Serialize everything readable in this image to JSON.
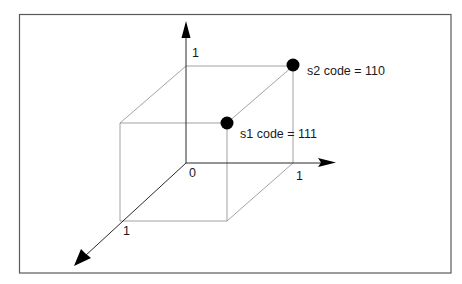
{
  "diagram": {
    "title": "",
    "type": "3D unit cube with binary state codes",
    "colors": {
      "frame": "#5a5a5a",
      "cube_edges": "#8c8c8c",
      "axes": "#2a2a2a",
      "points": "#000000",
      "text": "#1a1a1a"
    },
    "axes": {
      "vertical": {
        "tick_label": "1"
      },
      "horizontal": {
        "tick_label": "1"
      },
      "depth": {
        "tick_label": "1"
      },
      "origin_label": "0"
    },
    "points": [
      {
        "id": "s1",
        "label": "s1 code = 111"
      },
      {
        "id": "s2",
        "label": "s2 code = 110"
      }
    ]
  }
}
